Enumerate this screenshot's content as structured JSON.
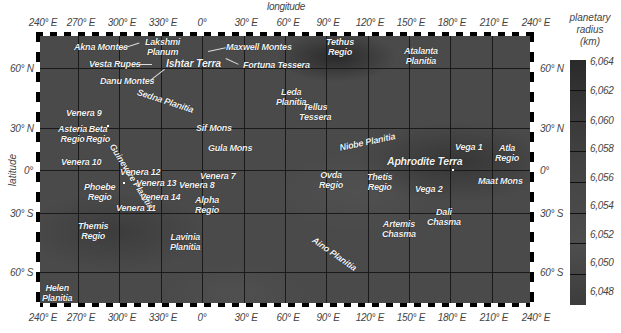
{
  "axes": {
    "x_title": "longitude",
    "y_title": "latitude",
    "longitude_ticks": [
      "240° E",
      "270° E",
      "300° E",
      "330° E",
      "0°",
      "30° E",
      "60° E",
      "90° E",
      "120° E",
      "150° E",
      "180° E",
      "210° E",
      "240° E"
    ],
    "latitude_ticks": [
      "60° N",
      "30° N",
      "0°",
      "30° S",
      "60° S"
    ]
  },
  "colorbar": {
    "title_line1": "planetary",
    "title_line2": "radius",
    "title_line3": "(km)",
    "ticks": [
      "6,064",
      "6,062",
      "6,060",
      "6,058",
      "6,056",
      "6,054",
      "6,052",
      "6,050",
      "6,048"
    ]
  },
  "features": {
    "akna_montes": "Akna Montes",
    "lakshmi_planum_1": "Lakshmi",
    "lakshmi_planum_2": "Planum",
    "maxwell_montes": "Maxwell Montes",
    "vesta_rupes": "Vesta Rupes",
    "ishtar_terra": "Ishtar Terra",
    "fortuna_tessera": "Fortuna Tessera",
    "danu_montes": "Danu Montes",
    "tethus_regio_1": "Tethus",
    "tethus_regio_2": "Regio",
    "atalanta_planitia_1": "Atalanta",
    "atalanta_planitia_2": "Planitia",
    "sedna_planitia": "Sedna Planitia",
    "leda_planitia_1": "Leda",
    "leda_planitia_2": "Planitia",
    "tellus_tessera_1": "Tellus",
    "tellus_tessera_2": "Tessera",
    "venera_9": "Venera 9",
    "asteria_regio_1": "Asteria",
    "asteria_regio_2": "Regio",
    "beta_regio_1": "Beta",
    "beta_regio_2": "Regio",
    "guinevere_planitia": "Guinevere Planitia",
    "sif_mons": "Sif Mons",
    "gula_mons": "Gula Mons",
    "niobe_planitia": "Niobe Planitia",
    "venera_10": "Venera 10",
    "vega_1": "Vega 1",
    "atla_regio_1": "Atla",
    "atla_regio_2": "Regio",
    "aphrodite_terra": "Aphrodite Terra",
    "venera_12": "Venera 12",
    "venera_7": "Venera 7",
    "venera_13": "Venera 13",
    "venera_8": "Venera 8",
    "phoebe_regio_1": "Phoebe",
    "phoebe_regio_2": "Regio",
    "venera_14": "Venera 14",
    "venera_11": "Venera 11",
    "ovda_regio_1": "Ovda",
    "ovda_regio_2": "Regio",
    "thetis_regio_1": "Thetis",
    "thetis_regio_2": "Regio",
    "maat_mons": "Maat Mons",
    "vega_2": "Vega 2",
    "alpha_regio_1": "Alpha",
    "alpha_regio_2": "Regio",
    "dali_chasma_1": "Dali",
    "dali_chasma_2": "Chasma",
    "themis_regio_1": "Themis",
    "themis_regio_2": "Regio",
    "artemis_chasma_1": "Artemis",
    "artemis_chasma_2": "Chasma",
    "aino_planitia": "Aino Planitia",
    "lavinia_planitia_1": "Lavinia",
    "lavinia_planitia_2": "Planitia",
    "helen_planitia_1": "Helen",
    "helen_planitia_2": "Planitia"
  }
}
